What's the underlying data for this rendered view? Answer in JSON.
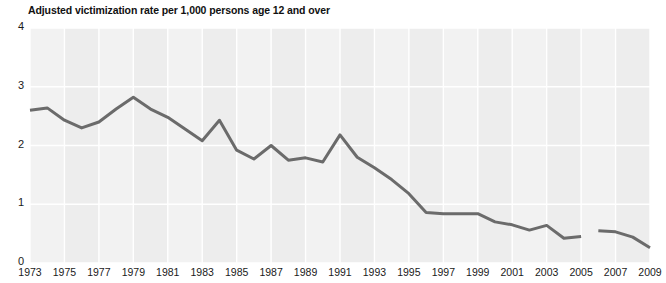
{
  "chart_data": {
    "type": "line",
    "title": "Adjusted victimization rate per 1,000 persons age 12 and over",
    "xlabel": "",
    "ylabel": "",
    "ylim": [
      0,
      4
    ],
    "xlim": [
      1973,
      2009
    ],
    "yticks": [
      "0",
      "1",
      "2",
      "3",
      "4"
    ],
    "ytick_values": [
      0,
      1,
      2,
      3,
      4
    ],
    "xticks": [
      "1973",
      "1975",
      "1977",
      "1979",
      "1981",
      "1983",
      "1985",
      "1987",
      "1989",
      "1991",
      "1993",
      "1995",
      "1997",
      "1999",
      "2001",
      "2003",
      "2005",
      "2007",
      "2009"
    ],
    "xtick_values": [
      1973,
      1975,
      1977,
      1979,
      1981,
      1983,
      1985,
      1987,
      1989,
      1991,
      1993,
      1995,
      1997,
      1999,
      2001,
      2003,
      2005,
      2007,
      2009
    ],
    "grid": true,
    "legend": "none",
    "line_color": "#6b6b6b",
    "plot_background": "#ededed",
    "gridline_color": "#ffffff",
    "band_color": "#f2f2f2",
    "series": [
      {
        "name": "Adjusted victimization rate",
        "x": [
          1973,
          1974,
          1975,
          1976,
          1977,
          1978,
          1979,
          1980,
          1981,
          1982,
          1983,
          1984,
          1985,
          1986,
          1987,
          1988,
          1989,
          1990,
          1991,
          1992,
          1993,
          1994,
          1995,
          1996,
          1997,
          1998,
          1999,
          2000,
          2001,
          2002,
          2003,
          2004,
          2005
        ],
        "values": [
          2.6,
          2.64,
          2.43,
          2.3,
          2.4,
          2.62,
          2.82,
          2.62,
          2.48,
          2.28,
          2.08,
          2.43,
          1.92,
          1.77,
          2.0,
          1.75,
          1.79,
          1.72,
          2.18,
          1.8,
          1.62,
          1.42,
          1.18,
          0.86,
          0.84,
          0.84,
          0.84,
          0.7,
          0.65,
          0.56,
          0.64,
          0.42,
          0.45
        ]
      },
      {
        "name": "Adjusted victimization rate (post-break)",
        "x": [
          2006,
          2007,
          2008,
          2009
        ],
        "values": [
          0.55,
          0.53,
          0.44,
          0.26
        ]
      }
    ]
  }
}
